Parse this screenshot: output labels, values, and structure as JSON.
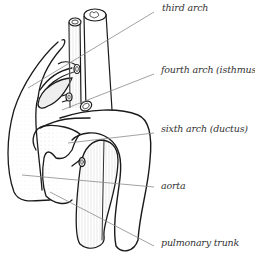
{
  "diagram": {
    "labels": [
      {
        "id": "third-arch",
        "text": "third arch",
        "x": 162,
        "y": 2
      },
      {
        "id": "fourth-arch",
        "text": "fourth arch (isthmus)",
        "x": 161,
        "y": 64
      },
      {
        "id": "sixth-arch",
        "text": "sixth arch (ductus)",
        "x": 161,
        "y": 123
      },
      {
        "id": "aorta",
        "text": "aorta",
        "x": 161,
        "y": 180
      },
      {
        "id": "pulmonary-trunk",
        "text": "pulmonary trunk",
        "x": 161,
        "y": 237
      }
    ],
    "colors": {
      "outline": "#1a1a1a",
      "leader": "#8a8a8a",
      "text": "#333333",
      "shading": "#bdbdbd"
    }
  }
}
